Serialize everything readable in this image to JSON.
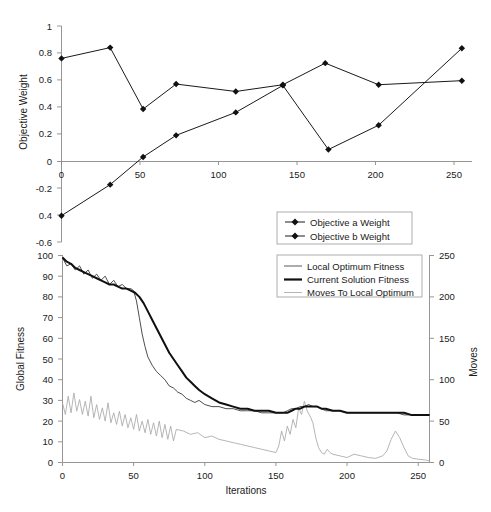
{
  "figure": {
    "background_color": "#ffffff",
    "axis_color": "#8a8a8a",
    "text_color": "#1a1a1a"
  },
  "chart_data": [
    {
      "id": "objective-weights",
      "type": "line",
      "title": "",
      "xlabel": "",
      "ylabel": "Objective Weight",
      "xlim": [
        -8,
        268
      ],
      "ylim": [
        -0.6,
        1.0
      ],
      "xticks": [
        0,
        50,
        100,
        150,
        200,
        250
      ],
      "xtick_labels": [
        "0",
        "50",
        "100",
        "150",
        "200",
        "250"
      ],
      "yticks": [
        1,
        0.8,
        0.6,
        0.4,
        0.2,
        0,
        -0.2,
        -0.4,
        -0.6
      ],
      "ytick_labels": [
        "1",
        "0.8",
        "0.6",
        "0.4",
        "0.2",
        "0",
        "-0.2",
        "0.4",
        "-0.6"
      ],
      "grid": false,
      "legend_position": "inside-lower-right",
      "series": [
        {
          "name": "Objective a Weight",
          "marker": "filled-diamond",
          "color": "#1a1a1a",
          "x": [
            0,
            31,
            52,
            73,
            111,
            141,
            168,
            202,
            255
          ],
          "y": [
            0.76,
            0.84,
            0.385,
            0.57,
            0.515,
            0.565,
            0.725,
            0.565,
            0.595
          ]
        },
        {
          "name": "Objective b Weight",
          "marker": "filled-diamond",
          "color": "#1a1a1a",
          "x": [
            0,
            31,
            52,
            73,
            111,
            141,
            170,
            202,
            255
          ],
          "y": [
            -0.405,
            -0.175,
            0.03,
            0.19,
            0.36,
            0.56,
            0.085,
            0.265,
            0.835
          ]
        }
      ]
    },
    {
      "id": "fitness-and-moves",
      "type": "line",
      "title": "",
      "xlabel": "Iterations",
      "ylabel": "Global Fitness",
      "y2label": "Moves",
      "xlim": [
        0,
        258
      ],
      "ylim": [
        0,
        100
      ],
      "y2lim": [
        0,
        250
      ],
      "xticks": [
        0,
        50,
        100,
        150,
        200,
        250
      ],
      "xtick_labels": [
        "0",
        "50",
        "100",
        "150",
        "200",
        "250"
      ],
      "yticks": [
        0,
        10,
        20,
        30,
        40,
        50,
        60,
        70,
        80,
        90,
        100
      ],
      "ytick_labels": [
        "0",
        "10",
        "20",
        "30",
        "40",
        "50",
        "60",
        "70",
        "80",
        "90",
        "100"
      ],
      "y2ticks": [
        0,
        50,
        100,
        150,
        200,
        250
      ],
      "y2tick_labels": [
        "0",
        "50",
        "100",
        "150",
        "200",
        "250"
      ],
      "grid": false,
      "legend_position": "upper-right",
      "series": [
        {
          "name": "Local Optimum Fitness",
          "axis": "left",
          "color": "#3a3a3a",
          "width": 0.9,
          "x": [
            0,
            3,
            6,
            9,
            12,
            15,
            18,
            21,
            24,
            27,
            30,
            33,
            36,
            39,
            42,
            45,
            48,
            50,
            52,
            54,
            56,
            58,
            60,
            63,
            66,
            69,
            72,
            75,
            78,
            81,
            84,
            87,
            90,
            93,
            96,
            100,
            105,
            110,
            115,
            120,
            125,
            130,
            135,
            140,
            145,
            150,
            155,
            158,
            161,
            164,
            167,
            170,
            173,
            176,
            179,
            182,
            185,
            190,
            195,
            200,
            205,
            210,
            215,
            220,
            225,
            230,
            235,
            240,
            245,
            250,
            255,
            258
          ],
          "y": [
            99,
            95,
            96,
            93,
            95,
            91,
            93,
            89,
            91,
            88,
            90,
            86,
            88,
            85,
            86,
            84,
            84,
            83,
            78,
            70,
            62,
            56,
            51,
            47,
            44,
            42,
            40,
            37,
            36,
            34,
            33,
            31,
            30,
            29,
            30,
            28,
            27,
            27,
            26,
            26,
            25,
            25,
            25,
            24,
            24,
            24,
            24,
            25,
            26,
            26,
            27,
            27,
            28,
            27,
            27,
            26,
            25,
            25,
            25,
            24,
            24,
            24,
            24,
            24,
            24,
            24,
            24,
            23,
            23,
            23,
            23,
            23
          ]
        },
        {
          "name": "Current Solution Fitness",
          "axis": "left",
          "color": "#101010",
          "width": 2.0,
          "x": [
            0,
            3,
            6,
            9,
            12,
            15,
            18,
            21,
            24,
            27,
            30,
            33,
            36,
            39,
            42,
            45,
            48,
            51,
            54,
            57,
            60,
            63,
            66,
            69,
            72,
            75,
            78,
            81,
            84,
            87,
            90,
            93,
            96,
            100,
            105,
            110,
            115,
            120,
            125,
            130,
            135,
            140,
            145,
            150,
            155,
            158,
            161,
            164,
            167,
            170,
            173,
            176,
            179,
            182,
            185,
            190,
            195,
            200,
            205,
            210,
            215,
            220,
            225,
            230,
            235,
            240,
            245,
            250,
            255,
            258
          ],
          "y": [
            99,
            97,
            96,
            94,
            93,
            92,
            91,
            90,
            89,
            88,
            87,
            86,
            86,
            85,
            84,
            84,
            83,
            82,
            80,
            77,
            73,
            69,
            65,
            61,
            57,
            53,
            50,
            47,
            44,
            41,
            39,
            37,
            35,
            33,
            31,
            29,
            28,
            27,
            26,
            26,
            25,
            25,
            25,
            24,
            24,
            24,
            25,
            26,
            26,
            27,
            27,
            27,
            27,
            26,
            26,
            25,
            25,
            24,
            24,
            24,
            24,
            24,
            24,
            24,
            24,
            24,
            23,
            23,
            23,
            23
          ]
        },
        {
          "name": "Moves To Local Optimum",
          "axis": "right",
          "color": "#adadad",
          "width": 0.9,
          "x": [
            0,
            2,
            4,
            6,
            8,
            10,
            12,
            14,
            16,
            18,
            20,
            22,
            24,
            26,
            28,
            30,
            32,
            34,
            36,
            38,
            40,
            42,
            44,
            46,
            48,
            50,
            52,
            54,
            56,
            58,
            60,
            62,
            64,
            66,
            68,
            70,
            72,
            74,
            76,
            78,
            80,
            85,
            90,
            95,
            100,
            105,
            110,
            115,
            120,
            125,
            130,
            135,
            140,
            145,
            150,
            152,
            154,
            156,
            158,
            160,
            162,
            164,
            166,
            168,
            170,
            172,
            174,
            176,
            178,
            180,
            182,
            184,
            186,
            188,
            190,
            195,
            200,
            205,
            210,
            215,
            220,
            225,
            228,
            231,
            234,
            237,
            240,
            243,
            246,
            250,
            255,
            258
          ],
          "y": [
            72,
            58,
            80,
            60,
            84,
            62,
            76,
            58,
            74,
            56,
            80,
            54,
            70,
            52,
            66,
            50,
            72,
            48,
            60,
            46,
            62,
            44,
            58,
            42,
            54,
            40,
            58,
            38,
            50,
            36,
            52,
            34,
            48,
            32,
            50,
            30,
            46,
            28,
            44,
            26,
            40,
            38,
            34,
            36,
            30,
            32,
            28,
            26,
            24,
            22,
            20,
            18,
            16,
            14,
            12,
            20,
            38,
            26,
            44,
            34,
            52,
            42,
            66,
            58,
            74,
            62,
            56,
            48,
            30,
            18,
            12,
            10,
            16,
            12,
            10,
            8,
            6,
            10,
            8,
            6,
            5,
            8,
            14,
            28,
            38,
            30,
            18,
            8,
            5,
            4,
            3,
            2
          ]
        }
      ]
    }
  ],
  "legends": {
    "top": {
      "items": [
        {
          "label": "Objective a Weight",
          "marker": "filled-diamond",
          "color": "#1a1a1a"
        },
        {
          "label": "Objective b Weight",
          "marker": "filled-diamond",
          "color": "#1a1a1a"
        }
      ]
    },
    "bottom": {
      "items": [
        {
          "label": "Local Optimum Fitness",
          "marker": "thin-line",
          "color": "#3a3a3a"
        },
        {
          "label": "Current Solution Fitness",
          "marker": "thick-line",
          "color": "#101010"
        },
        {
          "label": "Moves To Local Optimum",
          "marker": "light-line",
          "color": "#adadad"
        }
      ]
    }
  }
}
